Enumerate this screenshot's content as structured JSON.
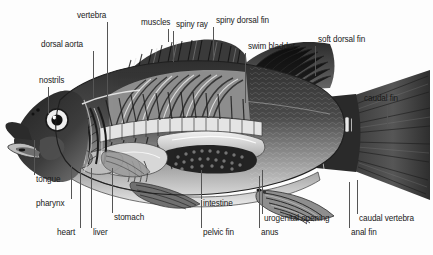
{
  "diagram": {
    "background_color": "#fdfdfd",
    "label_color": "#1a1a1a",
    "leader_color": "#555555",
    "palette": {
      "body_dark": "#3b3b3b",
      "body_mid": "#6e6e6e",
      "body_light": "#b8b8b8",
      "highlight": "#e6e6e6",
      "outline": "#2a2a2a",
      "near_black": "#1c1c1c"
    },
    "labels": [
      {
        "id": "vertebra",
        "text": "vertebra",
        "x": 77,
        "y": 11
      },
      {
        "id": "muscles",
        "text": "muscles",
        "x": 141,
        "y": 18
      },
      {
        "id": "spiny-ray",
        "text": "spiny ray",
        "x": 176,
        "y": 20
      },
      {
        "id": "spiny-dorsal-fin",
        "text": "spiny dorsal fin",
        "x": 216,
        "y": 16
      },
      {
        "id": "dorsal-aorta",
        "text": "dorsal aorta",
        "x": 41,
        "y": 40
      },
      {
        "id": "swim-bladder",
        "text": "swim bladder",
        "x": 248,
        "y": 42
      },
      {
        "id": "soft-dorsal-fin",
        "text": "soft dorsal fin",
        "x": 318,
        "y": 35
      },
      {
        "id": "nostrils",
        "text": "nostrils",
        "x": 39,
        "y": 76
      },
      {
        "id": "caudal-fin",
        "text": "caudal fin",
        "x": 364,
        "y": 94
      },
      {
        "id": "tongue",
        "text": "tongue",
        "x": 36,
        "y": 175
      },
      {
        "id": "intestine",
        "text": "intestine",
        "x": 203,
        "y": 199
      },
      {
        "id": "pharynx",
        "text": "pharynx",
        "x": 36,
        "y": 199
      },
      {
        "id": "stomach",
        "text": "stomach",
        "x": 114,
        "y": 213
      },
      {
        "id": "urogenital-opening",
        "text": "urogenital opening",
        "x": 264,
        "y": 214
      },
      {
        "id": "caudal-vertebra",
        "text": "caudal vertebra",
        "x": 359,
        "y": 214
      },
      {
        "id": "heart",
        "text": "heart",
        "x": 57,
        "y": 228
      },
      {
        "id": "liver",
        "text": "liver",
        "x": 93,
        "y": 228
      },
      {
        "id": "pelvic-fin",
        "text": "pelvic fin",
        "x": 203,
        "y": 228
      },
      {
        "id": "anus",
        "text": "anus",
        "x": 261,
        "y": 228
      },
      {
        "id": "anal-fin",
        "text": "anal fin",
        "x": 351,
        "y": 228
      }
    ],
    "leaders": [
      {
        "id": "vertebra-leader",
        "orient": "v",
        "x": 107,
        "y": 22,
        "len": 76
      },
      {
        "id": "muscles-leader",
        "orient": "v",
        "x": 168,
        "y": 29,
        "len": 13
      },
      {
        "id": "spiny-ray-leader",
        "orient": "v",
        "x": 173,
        "y": 31,
        "len": 31
      },
      {
        "id": "spiny-dorsal-fin-leader",
        "orient": "v",
        "x": 213,
        "y": 27,
        "len": 30
      },
      {
        "id": "dorsal-aorta-leader",
        "orient": "v",
        "x": 93,
        "y": 51,
        "len": 48
      },
      {
        "id": "swim-bladder-leader",
        "orient": "v",
        "x": 245,
        "y": 53,
        "len": 50
      },
      {
        "id": "soft-dorsal-fin-leader",
        "orient": "v",
        "x": 315,
        "y": 46,
        "len": 30
      },
      {
        "id": "nostrils-leader",
        "orient": "v",
        "x": 48,
        "y": 87,
        "len": 28
      },
      {
        "id": "caudal-fin-leader",
        "orient": "v",
        "x": 387,
        "y": 105,
        "len": 22
      },
      {
        "id": "tongue-leader",
        "orient": "v",
        "x": 34,
        "y": 140,
        "len": 35
      },
      {
        "id": "intestine-leader",
        "orient": "v",
        "x": 201,
        "y": 170,
        "len": 29
      },
      {
        "id": "pharynx-leader",
        "orient": "v",
        "x": 71,
        "y": 165,
        "len": 34
      },
      {
        "id": "stomach-leader",
        "orient": "v",
        "x": 112,
        "y": 168,
        "len": 45
      },
      {
        "id": "urogenital-opening-leader",
        "orient": "v",
        "x": 262,
        "y": 170,
        "len": 44
      },
      {
        "id": "caudal-vertebra-leader",
        "orient": "v",
        "x": 357,
        "y": 180,
        "len": 34
      },
      {
        "id": "heart-leader",
        "orient": "v",
        "x": 80,
        "y": 168,
        "len": 60
      },
      {
        "id": "liver-leader",
        "orient": "v",
        "x": 91,
        "y": 168,
        "len": 60
      },
      {
        "id": "pelvic-fin-leader",
        "orient": "v",
        "x": 201,
        "y": 200,
        "len": 28
      },
      {
        "id": "anus-leader",
        "orient": "v",
        "x": 259,
        "y": 176,
        "len": 52
      },
      {
        "id": "anal-fin-leader",
        "orient": "v",
        "x": 349,
        "y": 182,
        "len": 46
      }
    ]
  }
}
